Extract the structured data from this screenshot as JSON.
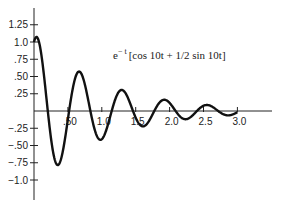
{
  "chart_data": {
    "type": "line",
    "annotation": {
      "base": "e",
      "exponent": "− t",
      "bracket": "[cos 10t + 1/2 sin 10t]"
    },
    "xlabel": "",
    "ylabel": "",
    "x_tick_labels": [
      ".50",
      "1.0",
      "1.5",
      "2.0",
      "2.5",
      "3.0"
    ],
    "x_ticks": [
      0.5,
      1.0,
      1.5,
      2.0,
      2.5,
      3.0
    ],
    "y_tick_labels": [
      "1.25",
      "1.0",
      ".75",
      ".50",
      ".25",
      "−.25",
      "−.50",
      "−.75",
      "−1.0"
    ],
    "y_ticks": [
      1.25,
      1.0,
      0.75,
      0.5,
      0.25,
      -0.25,
      -0.5,
      -0.75,
      -1.0
    ],
    "xlim": [
      0,
      3.5
    ],
    "ylim": [
      -1.3,
      1.5
    ],
    "grid": false,
    "legend": "none",
    "series": [
      {
        "name": "e^{-t}[cos 10t + 1/2 sin 10t]",
        "function": {
          "decay": 1,
          "omega": 10,
          "cos_coef": 1,
          "sin_coef": 0.5
        },
        "x": [
          0,
          0.1,
          0.2,
          0.3,
          0.4,
          0.5,
          0.6,
          0.7,
          0.8,
          0.9,
          1.0,
          1.2,
          1.4,
          1.6,
          1.8,
          2.0,
          2.2,
          2.4,
          2.6,
          2.8,
          3.0
        ],
        "values": [
          1.0,
          0.87,
          0.04,
          -0.75,
          -0.72,
          0.13,
          0.59,
          0.41,
          -0.23,
          -0.42,
          -0.14,
          0.29,
          -0.05,
          -0.01,
          -0.12,
          0.07,
          0.01,
          -0.05,
          0.06,
          0.0,
          0.0
        ]
      }
    ],
    "key_points": [
      {
        "label": "start",
        "x": 0,
        "y": 1.0
      },
      {
        "label": "first minimum",
        "x": 0.36,
        "y": -0.75
      },
      {
        "label": "first maximum",
        "x": 0.67,
        "y": 0.5
      }
    ]
  }
}
